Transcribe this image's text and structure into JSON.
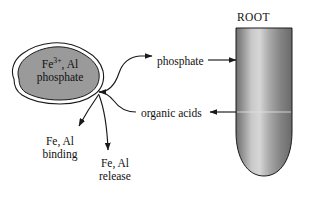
{
  "figure": {
    "width": 315,
    "height": 201,
    "background": "#ffffff"
  },
  "blob": {
    "line1_prefix": "Fe",
    "line1_superscript": "3+",
    "line1_suffix": ", Al",
    "line2": "phosphate",
    "fill_color": "#9a9a9a",
    "stroke_color": "#1a1a1a"
  },
  "root": {
    "label": "ROOT",
    "stroke_color": "#1a1a1a",
    "gradient_light": "#d8d8d8",
    "gradient_dark": "#6e6e6e"
  },
  "flows": {
    "phosphate": {
      "label": "phosphate",
      "direction": "right"
    },
    "organic_acids": {
      "label": "organic acids",
      "direction": "left"
    },
    "binding": {
      "line1": "Fe, Al",
      "line2": "binding",
      "direction": "down-left"
    },
    "release": {
      "line1": "Fe, Al",
      "line2": "release",
      "direction": "down"
    }
  },
  "colors": {
    "ink": "#111111",
    "arrow": "#1a1a1a"
  }
}
